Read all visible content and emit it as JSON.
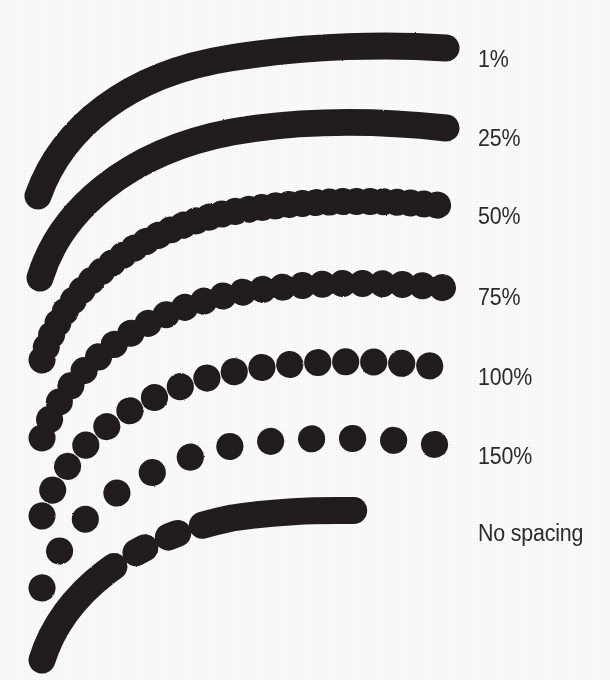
{
  "figure": {
    "background_color": "#fdfdfc",
    "ink_color": "#201f1f",
    "text_color": "#2b2b2b",
    "width": 610,
    "height": 680
  },
  "chart_data": {
    "type": "line",
    "xlabel": "",
    "ylabel": "",
    "legend_position": "right",
    "grid": false,
    "categories": [
      "1%",
      "25%",
      "50%",
      "75%",
      "100%",
      "150%",
      "No spacing"
    ],
    "values": [
      1,
      25,
      50,
      75,
      100,
      150,
      null
    ],
    "series": [
      {
        "name": "1%",
        "label": "1%",
        "spacing_percent": 1,
        "appearance": "solid",
        "dot_diameter": 27,
        "dot_gap": 0,
        "label_y": 46,
        "path": "M 38 196 C 62 128, 128 74, 230 58 C 310 45, 390 44, 446 48",
        "dash": "none"
      },
      {
        "name": "25%",
        "label": "25%",
        "spacing_percent": 25,
        "appearance": "solid",
        "dot_diameter": 27,
        "dot_gap": 0,
        "label_y": 125,
        "path": "M 40 278 C 60 212, 126 152, 232 132 C 312 118, 392 122, 446 128",
        "dash": "none"
      },
      {
        "name": "50%",
        "label": "50%",
        "spacing_percent": 50,
        "appearance": "near-solid-scalloped",
        "dot_diameter": 27,
        "dot_gap": 13.5,
        "label_y": 203,
        "path": "M 42 360 C 60 296, 126 232, 232 212 C 312 198, 392 200, 446 206",
        "dash": "0.2 13.3"
      },
      {
        "name": "75%",
        "label": "75%",
        "spacing_percent": 75,
        "appearance": "overlapping-dots",
        "dot_diameter": 27,
        "dot_gap": 20,
        "label_y": 284,
        "path": "M 42 438 C 62 378, 126 316, 232 294 C 312 280, 392 282, 446 288",
        "dash": "0.2 19.8"
      },
      {
        "name": "100%",
        "label": "100%",
        "spacing_percent": 100,
        "appearance": "touching-dots",
        "dot_diameter": 27,
        "dot_gap": 28,
        "label_y": 364,
        "path": "M 42 516 C 62 452, 126 394, 232 372 C 312 358, 392 360, 446 368",
        "dash": "0.2 27.8"
      },
      {
        "name": "150%",
        "label": "150%",
        "spacing_percent": 150,
        "appearance": "separated-dots",
        "dot_diameter": 27,
        "dot_gap": 41,
        "label_y": 443,
        "path": "M 42 588 C 62 526, 126 468, 232 446 C 312 434, 392 438, 446 446",
        "dash": "0.2 40.8"
      },
      {
        "name": "No spacing",
        "label": "No spacing",
        "spacing_percent": null,
        "appearance": "irregular-clumps",
        "dot_diameter": 27,
        "dot_gap": null,
        "label_y": 520,
        "path": "M 42 660 C 62 596, 126 540, 232 518 C 312 506, 392 510, 446 518",
        "dash": "110 0.2 10 26 10 26 10 26 92 0.2 20 0.2 40"
      }
    ]
  }
}
